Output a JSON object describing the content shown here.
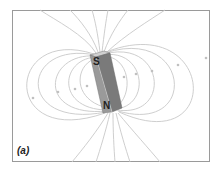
{
  "figure": {
    "panel_label": "(a)",
    "magnet": {
      "south_label": "S",
      "north_label": "N"
    },
    "colors": {
      "field_lines": "#c8c8c8",
      "magnet_front": "#9a9a9a",
      "magnet_side": "#7a7a7a",
      "magnet_top": "#d0d0d0",
      "frame": "#9a9a9a"
    }
  }
}
